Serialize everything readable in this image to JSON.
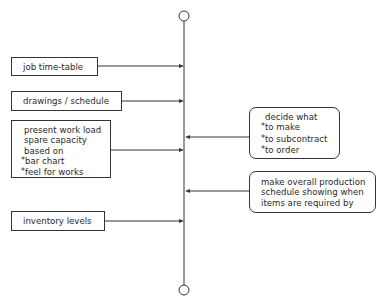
{
  "diagram": {
    "type": "flow-spine",
    "spine": {
      "start_node": "circle",
      "end_node": "circle",
      "color": "#333333"
    },
    "inputs_left": [
      {
        "id": "job",
        "lines": [
          "job time-table"
        ]
      },
      {
        "id": "drawings",
        "lines": [
          "drawings / schedule"
        ]
      },
      {
        "id": "workload",
        "lines": [
          "present work load",
          "spare capacity",
          "based on"
        ],
        "bullets": [
          "bar chart",
          "feel for works"
        ]
      },
      {
        "id": "inventory",
        "lines": [
          "inventory levels"
        ]
      }
    ],
    "outputs_right": [
      {
        "id": "decide",
        "lines": [
          "decide what"
        ],
        "bullets": [
          "to make",
          "to subcontract",
          "to order"
        ]
      },
      {
        "id": "schedule",
        "lines": [
          "make overall production",
          "schedule showing when",
          "items are required by"
        ]
      }
    ],
    "bullet_glyph": "*"
  }
}
